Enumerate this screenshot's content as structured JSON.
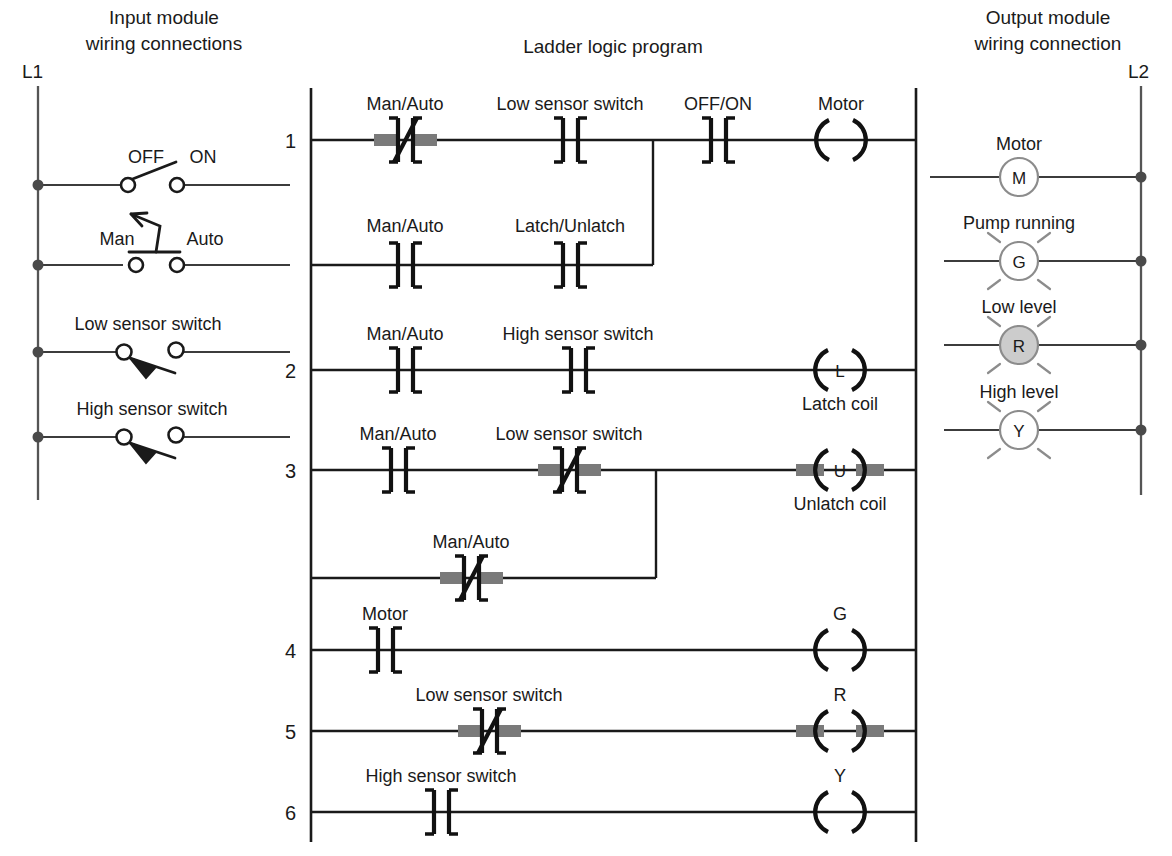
{
  "titles": {
    "input_module": "Input module\nwiring connections",
    "input_module_l1": "Input module",
    "input_module_l2": "wiring connections",
    "ladder": "Ladder logic program",
    "output_module_l1": "Output module",
    "output_module_l2": "wiring connection"
  },
  "rails": {
    "left_label": "L1",
    "right_label": "L2"
  },
  "input_module": {
    "switches": [
      {
        "name": "off-on-switch",
        "left_label": "OFF",
        "right_label": "ON",
        "type": "toggle"
      },
      {
        "name": "man-auto-selector",
        "left_label": "Man",
        "right_label": "Auto",
        "type": "selector"
      },
      {
        "name": "low-sensor-switch",
        "label": "Low sensor switch",
        "type": "level-sensor"
      },
      {
        "name": "high-sensor-switch",
        "label": "High sensor switch",
        "type": "level-sensor"
      }
    ]
  },
  "ladder": {
    "rung_numbers": [
      "1",
      "2",
      "3",
      "4",
      "5",
      "6"
    ],
    "rungs": [
      {
        "number": "1",
        "elements": [
          {
            "label": "Man/Auto",
            "type": "contact-nc",
            "highlighted": true
          },
          {
            "label": "Low sensor switch",
            "type": "contact-no",
            "highlighted": false
          },
          {
            "label": "OFF/ON",
            "type": "contact-no",
            "highlighted": false
          },
          {
            "label": "Motor",
            "type": "coil",
            "letter": "",
            "highlighted": false
          }
        ],
        "branch": [
          {
            "label": "Man/Auto",
            "type": "contact-no",
            "highlighted": false
          },
          {
            "label": "Latch/Unlatch",
            "type": "contact-no",
            "highlighted": false
          }
        ]
      },
      {
        "number": "2",
        "elements": [
          {
            "label": "Man/Auto",
            "type": "contact-no",
            "highlighted": false
          },
          {
            "label": "High sensor switch",
            "type": "contact-no",
            "highlighted": false
          },
          {
            "label": "",
            "type": "coil",
            "letter": "L",
            "sublabel": "Latch coil",
            "highlighted": false
          }
        ],
        "branch": []
      },
      {
        "number": "3",
        "elements": [
          {
            "label": "Man/Auto",
            "type": "contact-no",
            "highlighted": false
          },
          {
            "label": "Low sensor switch",
            "type": "contact-nc",
            "highlighted": true
          },
          {
            "label": "",
            "type": "coil",
            "letter": "U",
            "sublabel": "Unlatch coil",
            "highlighted": true
          }
        ],
        "branch": [
          {
            "label": "Man/Auto",
            "type": "contact-nc",
            "highlighted": true
          }
        ]
      },
      {
        "number": "4",
        "elements": [
          {
            "label": "Motor",
            "type": "contact-no",
            "highlighted": false
          },
          {
            "label": "G",
            "type": "coil",
            "letter": "",
            "highlighted": false
          }
        ],
        "branch": []
      },
      {
        "number": "5",
        "elements": [
          {
            "label": "Low sensor switch",
            "type": "contact-nc",
            "highlighted": true
          },
          {
            "label": "R",
            "type": "coil",
            "letter": "",
            "highlighted": true
          }
        ],
        "branch": []
      },
      {
        "number": "6",
        "elements": [
          {
            "label": "High sensor switch",
            "type": "contact-no",
            "highlighted": false
          },
          {
            "label": "Y",
            "type": "coil",
            "letter": "",
            "highlighted": false
          }
        ],
        "branch": []
      }
    ]
  },
  "output_module": {
    "devices": [
      {
        "name": "motor-output",
        "label": "Motor",
        "letter": "M",
        "kind": "motor",
        "energized": false
      },
      {
        "name": "pump-running-lamp",
        "label": "Pump running",
        "letter": "G",
        "kind": "lamp",
        "energized": false
      },
      {
        "name": "low-level-lamp",
        "label": "Low level",
        "letter": "R",
        "kind": "lamp",
        "energized": true
      },
      {
        "name": "high-level-lamp",
        "label": "High level",
        "letter": "Y",
        "kind": "lamp",
        "energized": false
      }
    ]
  },
  "colors": {
    "highlight": "#7a7a7a",
    "lamp_on_fill": "#cccccc",
    "wire": "#3c3c3c",
    "ink": "#1a1a1a"
  },
  "labels": {
    "man_auto": "Man/Auto",
    "low_sensor_switch": "Low sensor switch",
    "high_sensor_switch": "High sensor switch",
    "off_on": "OFF/ON",
    "latch_unlatch": "Latch/Unlatch",
    "motor": "Motor",
    "latch_coil": "Latch coil",
    "unlatch_coil": "Unlatch coil",
    "g": "G",
    "r": "R",
    "y": "Y",
    "l": "L",
    "u": "U",
    "m": "M",
    "off": "OFF",
    "on": "ON",
    "man": "Man",
    "auto": "Auto",
    "pump_running": "Pump running",
    "low_level": "Low level",
    "high_level": "High level"
  }
}
